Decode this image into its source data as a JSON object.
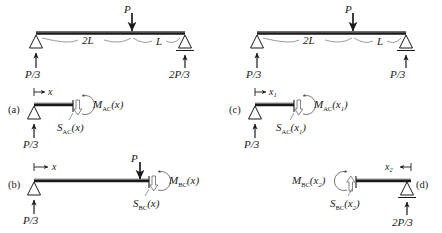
{
  "figure": {
    "panels": [
      {
        "id": "top-left",
        "label": "",
        "type": "full-beam",
        "load_label": "P",
        "span_left_label": "2L",
        "span_right_label": "L",
        "reaction_left_label": "P/3",
        "reaction_right_label": "2P/3",
        "support_left": "pin-triangle",
        "support_right": "roller-triangle"
      },
      {
        "id": "top-right",
        "label": "",
        "type": "full-beam",
        "load_label": "P",
        "span_left_label": "2L",
        "span_right_label": "L",
        "reaction_left_label": "P/3",
        "reaction_right_label": "2P/3",
        "support_left": "pin-triangle",
        "support_right": "roller-triangle"
      },
      {
        "id": "a",
        "label": "(a)",
        "type": "segment-left",
        "dim_label": "x",
        "moment_label": "M",
        "moment_sub": "AC",
        "moment_arg": "(x)",
        "shear_label": "S",
        "shear_sub": "AC",
        "shear_arg": "(x)",
        "reaction_label": "P/3",
        "has_point_load": false
      },
      {
        "id": "b",
        "label": "(b)",
        "type": "segment-left",
        "dim_label": "x",
        "load_label": "P",
        "moment_label": "M",
        "moment_sub": "BC",
        "moment_arg": "(x)",
        "shear_label": "S",
        "shear_sub": "BC",
        "shear_arg": "(x)",
        "reaction_label": "P/3",
        "has_point_load": true
      },
      {
        "id": "c",
        "label": "(c)",
        "type": "segment-left",
        "dim_label": "x",
        "dim_sub": "1",
        "moment_label": "M",
        "moment_sub": "AC",
        "moment_arg": "(x",
        "moment_arg_sub": "1",
        "moment_arg_end": ")",
        "shear_label": "S",
        "shear_sub": "AC",
        "shear_arg": "(x",
        "shear_arg_sub": "1",
        "shear_arg_end": ")",
        "reaction_label": "P/3",
        "has_point_load": false
      },
      {
        "id": "d",
        "label": "(d)",
        "type": "segment-right",
        "dim_label": "x",
        "dim_sub": "2",
        "moment_label": "M",
        "moment_sub": "BC",
        "moment_arg": "(x",
        "moment_arg_sub": "2",
        "moment_arg_end": ")",
        "shear_label": "S",
        "shear_sub": "BC",
        "shear_arg": "(x",
        "shear_arg_sub": "2",
        "shear_arg_end": ")",
        "reaction_label": "2P/3",
        "has_point_load": false
      }
    ],
    "colors": {
      "ink": "#1a1a1a",
      "thin": "#4a4a4a",
      "background": "#ffffff"
    }
  }
}
